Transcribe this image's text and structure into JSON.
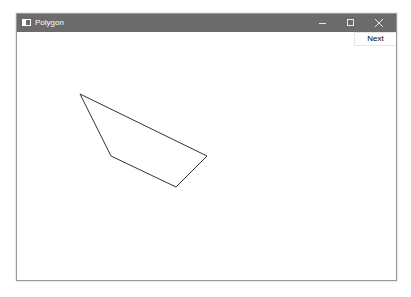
{
  "window": {
    "title": "Polygon",
    "icon": "app-window-icon",
    "controls": [
      "minimize-icon",
      "maximize-icon",
      "close-icon"
    ],
    "colors": {
      "titlebar": "#6b6b6b",
      "background": "#ffffff"
    }
  },
  "toolbar": {
    "next_label": "Next"
  },
  "canvas": {
    "polygon": {
      "stroke": "#333333",
      "points": [
        [
          80,
          94
        ],
        [
          207,
          156
        ],
        [
          176,
          187
        ],
        [
          111,
          156
        ]
      ]
    }
  }
}
